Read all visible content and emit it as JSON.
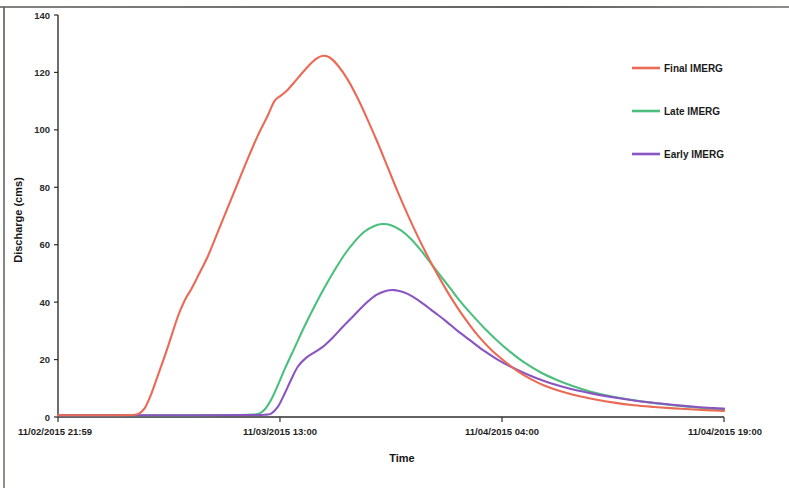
{
  "chart_data": {
    "type": "line",
    "title": "",
    "xlabel": "Time",
    "ylabel": "Discharge (cms)",
    "ylim": [
      0,
      140
    ],
    "yticks": [
      0,
      20,
      40,
      60,
      80,
      100,
      120,
      140
    ],
    "ytick_labels": [
      "0",
      "20",
      "40",
      "60",
      "80",
      "100",
      "120",
      "140"
    ],
    "xtick_labels": [
      "11/02/2015 21:59",
      "11/03/2015 13:00",
      "11/04/2015 04:00",
      "11/04/2015 19:00"
    ],
    "xtick_positions": [
      0,
      0.3333,
      0.6667,
      1.0
    ],
    "grid": false,
    "legend_position": "upper right",
    "series": [
      {
        "name": "Final IMERG",
        "color": "#ea6a56",
        "points": [
          [
            0.0,
            0.6
          ],
          [
            0.04,
            0.6
          ],
          [
            0.075,
            0.6
          ],
          [
            0.105,
            0.7
          ],
          [
            0.12,
            1.0
          ],
          [
            0.13,
            3.0
          ],
          [
            0.14,
            8.0
          ],
          [
            0.15,
            14.5
          ],
          [
            0.16,
            21.0
          ],
          [
            0.17,
            28.0
          ],
          [
            0.18,
            35.0
          ],
          [
            0.19,
            40.5
          ],
          [
            0.2,
            44.5
          ],
          [
            0.21,
            49.0
          ],
          [
            0.225,
            56.0
          ],
          [
            0.24,
            64.5
          ],
          [
            0.255,
            73.0
          ],
          [
            0.27,
            81.5
          ],
          [
            0.285,
            90.0
          ],
          [
            0.3,
            98.0
          ],
          [
            0.315,
            105.0
          ],
          [
            0.325,
            110.0
          ],
          [
            0.335,
            112.0
          ],
          [
            0.345,
            114.0
          ],
          [
            0.36,
            118.0
          ],
          [
            0.375,
            122.0
          ],
          [
            0.388,
            124.8
          ],
          [
            0.398,
            125.8
          ],
          [
            0.408,
            125.2
          ],
          [
            0.42,
            122.5
          ],
          [
            0.435,
            117.5
          ],
          [
            0.45,
            111.0
          ],
          [
            0.465,
            103.5
          ],
          [
            0.48,
            95.5
          ],
          [
            0.495,
            87.0
          ],
          [
            0.51,
            78.5
          ],
          [
            0.525,
            70.5
          ],
          [
            0.54,
            63.0
          ],
          [
            0.555,
            56.0
          ],
          [
            0.57,
            49.5
          ],
          [
            0.585,
            43.5
          ],
          [
            0.6,
            38.0
          ],
          [
            0.615,
            33.0
          ],
          [
            0.63,
            28.5
          ],
          [
            0.65,
            23.5
          ],
          [
            0.67,
            19.5
          ],
          [
            0.69,
            16.0
          ],
          [
            0.71,
            13.2
          ],
          [
            0.73,
            11.0
          ],
          [
            0.755,
            9.0
          ],
          [
            0.78,
            7.4
          ],
          [
            0.805,
            6.2
          ],
          [
            0.835,
            5.0
          ],
          [
            0.865,
            4.1
          ],
          [
            0.895,
            3.5
          ],
          [
            0.925,
            3.0
          ],
          [
            0.955,
            2.6
          ],
          [
            0.98,
            2.3
          ],
          [
            1.0,
            2.1
          ]
        ]
      },
      {
        "name": "Late IMERG",
        "color": "#4cbf7e",
        "points": [
          [
            0.0,
            0.6
          ],
          [
            0.1,
            0.6
          ],
          [
            0.18,
            0.6
          ],
          [
            0.25,
            0.7
          ],
          [
            0.285,
            0.8
          ],
          [
            0.3,
            1.0
          ],
          [
            0.31,
            2.5
          ],
          [
            0.32,
            6.0
          ],
          [
            0.33,
            11.0
          ],
          [
            0.34,
            16.5
          ],
          [
            0.355,
            24.0
          ],
          [
            0.37,
            31.5
          ],
          [
            0.385,
            38.5
          ],
          [
            0.4,
            45.0
          ],
          [
            0.415,
            51.0
          ],
          [
            0.43,
            56.5
          ],
          [
            0.445,
            61.0
          ],
          [
            0.46,
            64.5
          ],
          [
            0.475,
            66.5
          ],
          [
            0.487,
            67.2
          ],
          [
            0.5,
            66.8
          ],
          [
            0.515,
            65.0
          ],
          [
            0.53,
            62.0
          ],
          [
            0.545,
            58.0
          ],
          [
            0.56,
            53.5
          ],
          [
            0.575,
            49.0
          ],
          [
            0.59,
            44.5
          ],
          [
            0.605,
            40.0
          ],
          [
            0.62,
            36.0
          ],
          [
            0.64,
            31.0
          ],
          [
            0.66,
            26.5
          ],
          [
            0.68,
            22.5
          ],
          [
            0.7,
            19.0
          ],
          [
            0.725,
            15.5
          ],
          [
            0.75,
            12.8
          ],
          [
            0.775,
            10.6
          ],
          [
            0.8,
            8.8
          ],
          [
            0.83,
            7.2
          ],
          [
            0.86,
            6.0
          ],
          [
            0.89,
            5.0
          ],
          [
            0.92,
            4.2
          ],
          [
            0.95,
            3.5
          ],
          [
            0.975,
            3.0
          ],
          [
            1.0,
            2.6
          ]
        ]
      },
      {
        "name": "Early IMERG",
        "color": "#8a55c2",
        "points": [
          [
            0.0,
            0.6
          ],
          [
            0.12,
            0.6
          ],
          [
            0.22,
            0.6
          ],
          [
            0.29,
            0.7
          ],
          [
            0.31,
            0.8
          ],
          [
            0.32,
            1.2
          ],
          [
            0.33,
            3.5
          ],
          [
            0.34,
            8.0
          ],
          [
            0.35,
            13.0
          ],
          [
            0.36,
            17.5
          ],
          [
            0.372,
            20.5
          ],
          [
            0.385,
            22.5
          ],
          [
            0.398,
            24.5
          ],
          [
            0.412,
            27.5
          ],
          [
            0.428,
            31.5
          ],
          [
            0.445,
            35.5
          ],
          [
            0.462,
            39.5
          ],
          [
            0.478,
            42.5
          ],
          [
            0.492,
            43.9
          ],
          [
            0.505,
            44.2
          ],
          [
            0.518,
            43.5
          ],
          [
            0.532,
            42.0
          ],
          [
            0.548,
            39.5
          ],
          [
            0.565,
            36.5
          ],
          [
            0.582,
            33.5
          ],
          [
            0.6,
            30.0
          ],
          [
            0.62,
            26.5
          ],
          [
            0.64,
            23.0
          ],
          [
            0.66,
            20.0
          ],
          [
            0.68,
            17.5
          ],
          [
            0.705,
            14.8
          ],
          [
            0.73,
            12.5
          ],
          [
            0.755,
            10.7
          ],
          [
            0.78,
            9.2
          ],
          [
            0.81,
            7.8
          ],
          [
            0.84,
            6.6
          ],
          [
            0.87,
            5.6
          ],
          [
            0.9,
            4.8
          ],
          [
            0.93,
            4.1
          ],
          [
            0.96,
            3.5
          ],
          [
            0.985,
            3.1
          ],
          [
            1.0,
            2.9
          ]
        ]
      }
    ]
  },
  "legend": {
    "items": [
      {
        "label": "Final IMERG",
        "color": "#ea6a56"
      },
      {
        "label": "Late IMERG",
        "color": "#4cbf7e"
      },
      {
        "label": "Early IMERG",
        "color": "#8a55c2"
      }
    ]
  }
}
